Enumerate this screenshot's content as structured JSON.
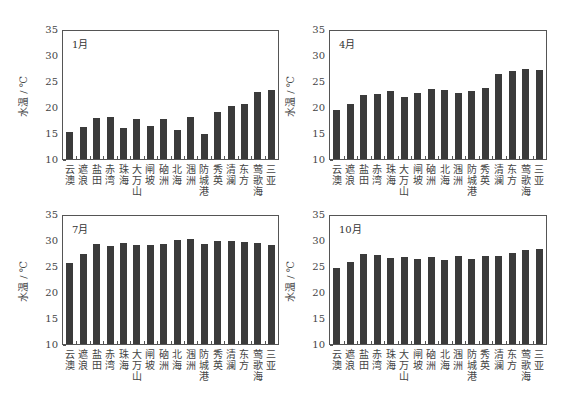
{
  "chart_data": [
    {
      "type": "bar",
      "title": "1月",
      "xlabel": "",
      "ylabel": "水温 / ℃",
      "ylim": [
        10,
        35
      ],
      "yticks": [
        10,
        15,
        20,
        25,
        30,
        35
      ],
      "categories": [
        "云澳",
        "遮浪",
        "盐田",
        "赤湾",
        "珠海",
        "大万山",
        "闸坡",
        "硇洲",
        "北海",
        "涠洲",
        "防城港",
        "秀英",
        "清澜",
        "东方",
        "莺歌海",
        "三亚"
      ],
      "values": [
        15.2,
        16.2,
        17.9,
        18.1,
        15.9,
        17.7,
        16.3,
        17.7,
        15.6,
        18.0,
        14.9,
        19.1,
        20.2,
        20.6,
        22.8,
        23.3
      ],
      "grid": false
    },
    {
      "type": "bar",
      "title": "4月",
      "xlabel": "",
      "ylabel": "水温 / ℃",
      "ylim": [
        10,
        35
      ],
      "yticks": [
        10,
        15,
        20,
        25,
        30,
        35
      ],
      "categories": [
        "云澳",
        "遮浪",
        "盐田",
        "赤湾",
        "珠海",
        "大万山",
        "闸坡",
        "硇洲",
        "北海",
        "涠洲",
        "防城港",
        "秀英",
        "清澜",
        "东方",
        "莺歌海",
        "三亚"
      ],
      "values": [
        19.4,
        20.5,
        22.3,
        22.5,
        23.0,
        21.9,
        22.7,
        23.4,
        23.3,
        22.7,
        23.1,
        23.6,
        26.3,
        26.9,
        27.3,
        27.2
      ],
      "grid": false
    },
    {
      "type": "bar",
      "title": "7月",
      "xlabel": "",
      "ylabel": "水温 / ℃",
      "ylim": [
        10,
        35
      ],
      "yticks": [
        10,
        15,
        20,
        25,
        30,
        35
      ],
      "categories": [
        "云澳",
        "遮浪",
        "盐田",
        "赤湾",
        "珠海",
        "大万山",
        "闸坡",
        "硇洲",
        "北海",
        "涠洲",
        "防城港",
        "秀英",
        "清澜",
        "东方",
        "莺歌海",
        "三亚"
      ],
      "values": [
        25.6,
        27.4,
        29.2,
        28.8,
        29.4,
        29.1,
        29.1,
        29.2,
        30.0,
        30.2,
        29.3,
        29.8,
        29.8,
        29.7,
        29.4,
        29.1
      ],
      "grid": false
    },
    {
      "type": "bar",
      "title": "10月",
      "xlabel": "",
      "ylabel": "水温 / ℃",
      "ylim": [
        10,
        35
      ],
      "yticks": [
        10,
        15,
        20,
        25,
        30,
        35
      ],
      "categories": [
        "云澳",
        "遮浪",
        "盐田",
        "赤湾",
        "珠海",
        "大万山",
        "闸坡",
        "硇洲",
        "北海",
        "涠洲",
        "防城港",
        "秀英",
        "清澜",
        "东方",
        "莺歌海",
        "三亚"
      ],
      "values": [
        24.7,
        25.7,
        27.3,
        27.1,
        26.5,
        26.7,
        26.3,
        26.8,
        26.2,
        27.0,
        26.4,
        26.9,
        26.9,
        27.5,
        28.0,
        28.3
      ],
      "grid": false
    }
  ],
  "style": {
    "bar_color": "#3b3b3b",
    "axis_color": "#555555"
  }
}
